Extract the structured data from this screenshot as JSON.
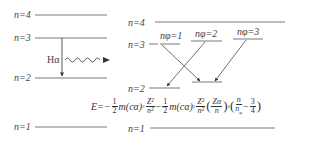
{
  "left_diagram": {
    "levels": [
      {
        "label": "n=4",
        "y": 15
      },
      {
        "label": "n=3",
        "y": 38
      },
      {
        "label": "n=2",
        "y": 78
      },
      {
        "label": "n=1",
        "y": 127
      }
    ],
    "transition_label": "Hα",
    "transition": {
      "from": "n=3",
      "to": "n=2"
    }
  },
  "right_diagram": {
    "levels": [
      {
        "label": "n=4",
        "y": 22
      },
      {
        "label": "n=3",
        "y": 44
      },
      {
        "label": "n=2",
        "y": 88
      },
      {
        "label": "n=1",
        "y": 128
      }
    ],
    "sublevels": [
      {
        "label": "nφ=1"
      },
      {
        "label": "nφ=2"
      },
      {
        "label": "nφ=3"
      }
    ]
  },
  "formula": {
    "lhs": "E=−",
    "half": {
      "num": "1",
      "den": "2"
    },
    "term1_mc": "m(cα)",
    "term1_sq": "2",
    "z2_over_n2": {
      "num": "Z²",
      "den": "n²"
    },
    "minus": "−",
    "za_over_n": {
      "num": "Zα",
      "den": "n"
    },
    "n_over_nphi": {
      "num": "n",
      "den": "n"
    },
    "nphi_sub": "φ",
    "three_quarters": {
      "num": "3",
      "den": "4"
    }
  }
}
